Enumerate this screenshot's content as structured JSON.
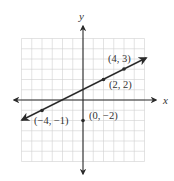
{
  "chart_data": {
    "type": "line",
    "title": "",
    "xlabel": "x",
    "ylabel": "y",
    "xlim": [
      -6,
      6
    ],
    "ylim": [
      -6,
      6
    ],
    "grid": true,
    "grid_step": 1,
    "legend": null,
    "series": [
      {
        "name": "line",
        "equation": "y = (1/2)x + 1",
        "x": [
          -4,
          2,
          4
        ],
        "y": [
          -1,
          2,
          3
        ],
        "arrows_both_ends": true
      }
    ],
    "points": [
      {
        "x": -4,
        "y": -1,
        "label": "(−4, −1)",
        "on_line": true
      },
      {
        "x": 2,
        "y": 2,
        "label": "(2, 2)",
        "on_line": true
      },
      {
        "x": 4,
        "y": 3,
        "label": "(4, 3)",
        "on_line": true
      },
      {
        "x": 0,
        "y": -2,
        "label": "(0, −2)",
        "on_line": false
      }
    ]
  },
  "labels": {
    "x_axis": "x",
    "y_axis": "y",
    "p1": "(4, 3)",
    "p2": "(2, 2)",
    "p3": "(−4, −1)",
    "p4": "(0, −2)"
  },
  "colors": {
    "axis": "#2a2a2a",
    "grid": "#d0d0d0",
    "line": "#2a2a2a",
    "text": "#333333"
  }
}
